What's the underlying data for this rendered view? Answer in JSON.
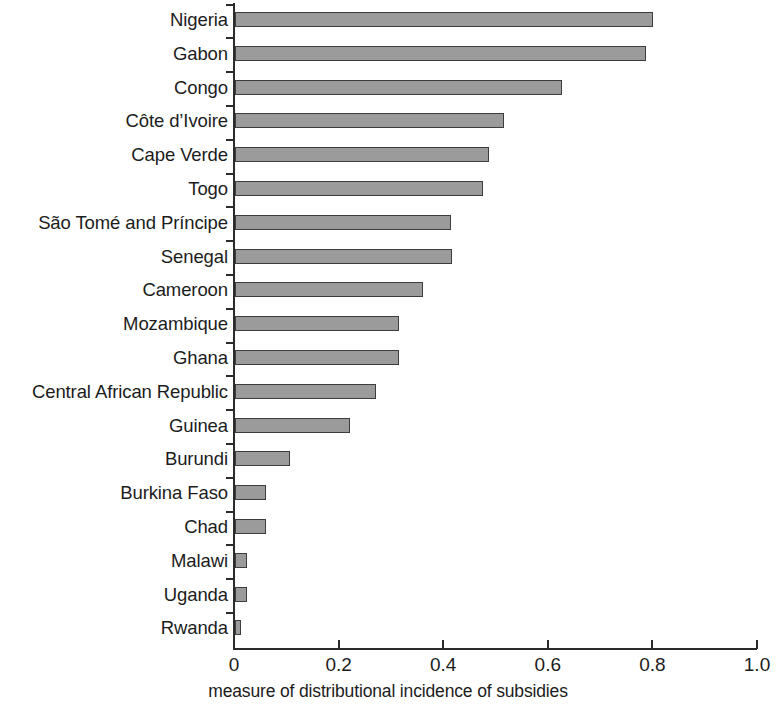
{
  "chart_data": {
    "type": "bar",
    "orientation": "horizontal",
    "title": "",
    "xlabel": "measure of distributional incidence of subsidies",
    "ylabel": "",
    "xlim": [
      0,
      1.0
    ],
    "xticks": [
      "0",
      "0.2",
      "0.4",
      "0.6",
      "0.8",
      "1.0"
    ],
    "xtick_values": [
      0,
      0.2,
      0.4,
      0.6,
      0.8,
      1.0
    ],
    "grid": false,
    "legend": false,
    "bar_fill_color": "#9b9b9b",
    "bar_border_color": "#3d3d3d",
    "axis_color": "#2b2b2b",
    "categories": [
      "Nigeria",
      "Gabon",
      "Congo",
      "Côte d’Ivoire",
      "Cape Verde",
      "Togo",
      "São Tomé and Príncipe",
      "Senegal",
      "Cameroon",
      "Mozambique",
      "Ghana",
      "Central African Republic",
      "Guinea",
      "Burundi",
      "Burkina Faso",
      "Chad",
      "Malawi",
      "Uganda",
      "Rwanda"
    ],
    "values": [
      0.8,
      0.785,
      0.625,
      0.515,
      0.485,
      0.475,
      0.413,
      0.415,
      0.36,
      0.313,
      0.313,
      0.27,
      0.22,
      0.105,
      0.06,
      0.06,
      0.022,
      0.022,
      0.012
    ]
  }
}
